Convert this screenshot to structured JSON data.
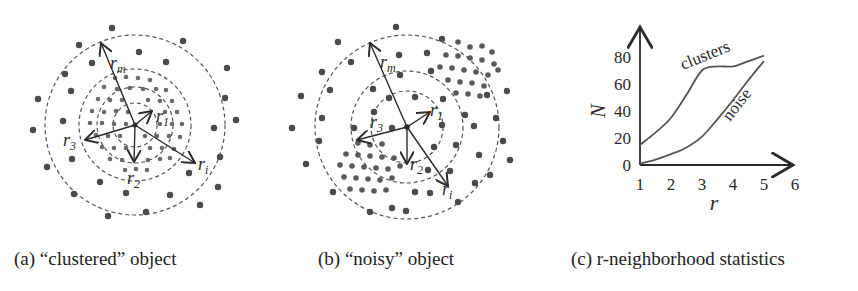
{
  "figure": {
    "panels": [
      {
        "id": "a",
        "caption": "(a) “clustered” object",
        "labels": {
          "rm": "r",
          "rm_sub": "m",
          "r1": "r",
          "r1_sub": "1",
          "r2": "r",
          "r2_sub": "2",
          "r3": "r",
          "r3_sub": "3",
          "ri": "r",
          "ri_sub": "i"
        }
      },
      {
        "id": "b",
        "caption": "(b) “noisy” object",
        "labels": {
          "rm": "r",
          "rm_sub": "m",
          "r1": "r",
          "r1_sub": "1",
          "r2": "r",
          "r2_sub": "2",
          "r3": "r",
          "r3_sub": "3",
          "ri": "r",
          "ri_sub": "i"
        }
      },
      {
        "id": "c",
        "caption": "(c) r-neighborhood statistics"
      }
    ],
    "colors": {
      "dot": "#4a4a4a",
      "ink": "#2a2a2a",
      "dashed": "#555555",
      "curve": "#555555"
    }
  },
  "chart_data": {
    "type": "line",
    "title": "r-neighborhood statistics",
    "xlabel": "r",
    "ylabel": "N",
    "x_ticks": [
      "1",
      "2",
      "3",
      "4",
      "5",
      "6"
    ],
    "y_ticks": [
      "0",
      "20",
      "40",
      "60",
      "80"
    ],
    "xlim": [
      1,
      6
    ],
    "ylim": [
      0,
      80
    ],
    "grid": false,
    "legend": "inline labels",
    "series": [
      {
        "name": "clusters",
        "x": [
          1,
          1.5,
          2,
          2.5,
          3,
          3.5,
          4,
          4.5,
          5
        ],
        "values": [
          15,
          24,
          35,
          52,
          70,
          73,
          73,
          77,
          81
        ]
      },
      {
        "name": "noise",
        "x": [
          1,
          1.5,
          2,
          2.5,
          3,
          3.5,
          4,
          4.5,
          5
        ],
        "values": [
          1,
          4,
          8,
          13,
          21,
          34,
          48,
          63,
          77
        ]
      }
    ]
  }
}
